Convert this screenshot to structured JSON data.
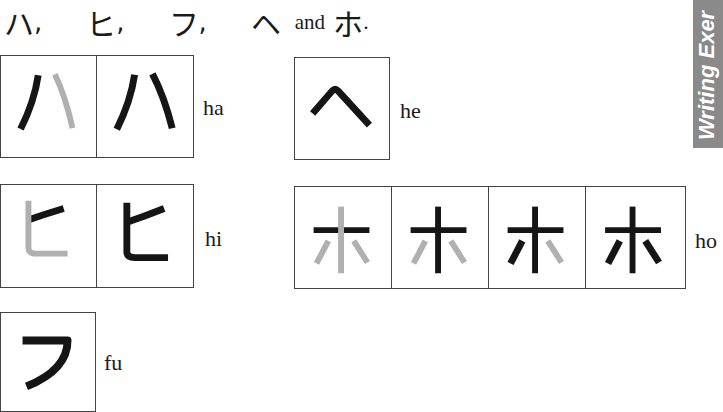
{
  "header": {
    "kana": [
      "ハ",
      "ヒ",
      "フ",
      "ヘ"
    ],
    "separator": ",",
    "and_label": "and",
    "last_kana": "ホ",
    "period": "."
  },
  "side_tab": {
    "label": "Writing Exer",
    "color": "#8a8a8a"
  },
  "colors": {
    "stroke_done": "#151515",
    "stroke_guide": "#b0b0b0",
    "border": "#444444"
  },
  "characters": [
    {
      "kana": "ハ",
      "romaji": "ha",
      "steps": 2
    },
    {
      "kana": "ヘ",
      "romaji": "he",
      "steps": 1
    },
    {
      "kana": "ヒ",
      "romaji": "hi",
      "steps": 2
    },
    {
      "kana": "ホ",
      "romaji": "ho",
      "steps": 4
    },
    {
      "kana": "フ",
      "romaji": "fu",
      "steps": 1
    }
  ]
}
